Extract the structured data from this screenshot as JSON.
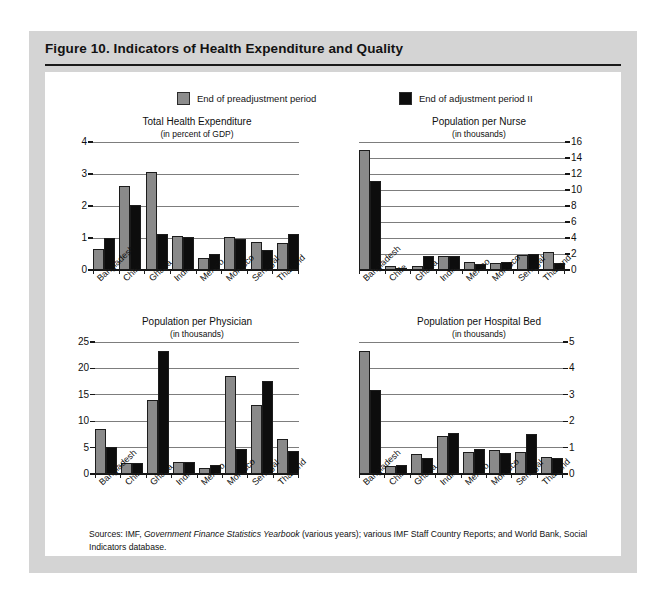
{
  "figure": {
    "title": "Figure 10.  Indicators of Health Expenditure and Quality",
    "sources_prefix": "Sources:  IMF,",
    "sources_italic": "Government Finance Statistics Yearbook",
    "sources_suffix": " (various years); various IMF Staff Country Reports; and World Bank, Social Indicators database."
  },
  "legend": {
    "series": [
      {
        "label": "End of preadjustment period",
        "color": "#8a8a8a"
      },
      {
        "label": "End of adjustment period II",
        "color": "#0d0d0d"
      }
    ]
  },
  "colors": {
    "frame": "#d4d4d4",
    "panel": "#ffffff",
    "gray_series": "#8a8a8a",
    "black_series": "#0d0d0d",
    "gridline": "#7d7d7d",
    "axis": "#151515"
  },
  "chart_data": [
    {
      "id": "total-health-expenditure",
      "type": "bar",
      "title": "Total Health Expenditure",
      "subtitle": "(in percent of GDP)",
      "xlabel": "",
      "ylabel": "",
      "ylim": [
        0,
        4
      ],
      "yticks": [
        0,
        1,
        2,
        3,
        4
      ],
      "ytick_labels": [
        "0",
        "1",
        "2",
        "3",
        "4"
      ],
      "axis_side": "left",
      "grid": true,
      "legend_position": "top",
      "categories": [
        "Bangladesh",
        "Chile",
        "Ghana",
        "India",
        "Mexico",
        "Morocco",
        "Senegal",
        "Thailand"
      ],
      "series": [
        {
          "name": "End of preadjustment period",
          "values": [
            0.66,
            2.63,
            3.05,
            1.06,
            0.38,
            1.03,
            0.87,
            0.83
          ]
        },
        {
          "name": "End of adjustment period II",
          "values": [
            1.0,
            2.02,
            1.12,
            1.02,
            0.5,
            0.97,
            0.61,
            1.14
          ]
        }
      ]
    },
    {
      "id": "population-per-nurse",
      "type": "bar",
      "title": "Population per Nurse",
      "subtitle": "(in thousands)",
      "xlabel": "",
      "ylabel": "",
      "ylim": [
        0,
        16
      ],
      "yticks": [
        0,
        2,
        4,
        6,
        8,
        10,
        12,
        14,
        16
      ],
      "ytick_labels": [
        "0",
        "2",
        "4",
        "6",
        "8",
        "10",
        "12",
        "14",
        "16"
      ],
      "axis_side": "right",
      "grid": true,
      "legend_position": "top",
      "categories": [
        "Bangladesh",
        "Chile",
        "Ghana",
        "India",
        "Mexico",
        "Morocco",
        "Senegal",
        "Thailand"
      ],
      "series": [
        {
          "name": "End of preadjustment period",
          "values": [
            15.0,
            0.45,
            0.5,
            1.7,
            1.0,
            0.85,
            1.9,
            2.2
          ]
        },
        {
          "name": "End of adjustment period II",
          "values": [
            11.1,
            0.2,
            1.75,
            1.75,
            0.75,
            0.95,
            2.0,
            0.85
          ]
        }
      ]
    },
    {
      "id": "population-per-physician",
      "type": "bar",
      "title": "Population per Physician",
      "subtitle": "(in thousands)",
      "xlabel": "",
      "ylabel": "",
      "ylim": [
        0,
        25
      ],
      "yticks": [
        0,
        5,
        10,
        15,
        20,
        25
      ],
      "ytick_labels": [
        "0",
        "5",
        "10",
        "15",
        "20",
        "25"
      ],
      "axis_side": "left",
      "grid": true,
      "legend_position": "top",
      "categories": [
        "Bangladesh",
        "Chile",
        "Ghana",
        "India",
        "Mexico",
        "Morocco",
        "Senegal",
        "Thailand"
      ],
      "series": [
        {
          "name": "End of preadjustment period",
          "values": [
            8.5,
            2.1,
            14.1,
            2.3,
            1.1,
            18.6,
            13.0,
            6.7
          ]
        },
        {
          "name": "End of adjustment period II",
          "values": [
            5.2,
            2.0,
            23.3,
            2.3,
            1.7,
            4.8,
            17.6,
            4.4
          ]
        }
      ]
    },
    {
      "id": "population-per-hospital-bed",
      "type": "bar",
      "title": "Population per Hospital Bed",
      "subtitle": "(in thousands)",
      "xlabel": "",
      "ylabel": "",
      "ylim": [
        0,
        5
      ],
      "yticks": [
        0,
        1,
        2,
        3,
        4,
        5
      ],
      "ytick_labels": [
        "0",
        "1",
        "2",
        "3",
        "4",
        "5"
      ],
      "axis_side": "right",
      "grid": true,
      "legend_position": "top",
      "categories": [
        "Bangladesh",
        "Chile",
        "Ghana",
        "India",
        "Mexico",
        "Morocco",
        "Senegal",
        "Thailand"
      ],
      "series": [
        {
          "name": "End of preadjustment period",
          "values": [
            4.65,
            0.3,
            0.75,
            1.45,
            0.85,
            0.9,
            0.85,
            0.65
          ]
        },
        {
          "name": "End of adjustment period II",
          "values": [
            3.2,
            0.35,
            0.6,
            1.55,
            0.95,
            0.8,
            1.5,
            0.6
          ]
        }
      ]
    }
  ]
}
